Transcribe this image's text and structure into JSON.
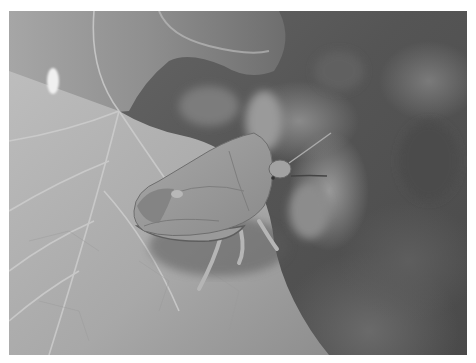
{
  "image": {
    "subject": "shield bug on leaf",
    "style": "grayscale photograph",
    "colors": {
      "border": "#ffffff",
      "leaf_light": "#b4b4b4",
      "leaf_mid": "#a0a0a0",
      "background_dark": "#555555",
      "bug_body": "#9c9c9c",
      "bug_shadow": "#5a5a5a"
    }
  }
}
